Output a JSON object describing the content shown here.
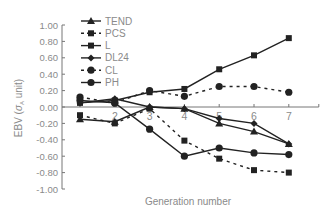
{
  "chart_data": {
    "type": "line",
    "title": "",
    "xlabel": "Generation number",
    "ylabel": "EBV (σA unit)",
    "ylabel_main": "EBV (",
    "ylabel_sigma": "σ",
    "ylabel_sub": "A",
    "ylabel_tail": " unit)",
    "x": [
      1,
      2,
      3,
      4,
      5,
      6,
      7
    ],
    "x_tick_labels": [
      "1",
      "2",
      "3",
      "4",
      "5",
      "6",
      "7"
    ],
    "ylim": [
      -1.0,
      1.0
    ],
    "y_ticks": [
      1.0,
      0.8,
      0.6,
      0.4,
      0.2,
      0.0,
      -0.2,
      -0.4,
      -0.6,
      -0.8,
      -1.0
    ],
    "y_tick_labels": [
      "1.00",
      "0.80",
      "0.60",
      "0.40",
      "0.20",
      "0.00",
      "-0.20",
      "-0.40",
      "-0.60",
      "-0.80",
      "-1.00"
    ],
    "grid": false,
    "legend_position": "upper-left",
    "series": [
      {
        "name": "TEND",
        "marker": "triangle",
        "dash": false,
        "values": [
          -0.15,
          -0.18,
          0.0,
          -0.02,
          -0.2,
          -0.3,
          -0.45
        ]
      },
      {
        "name": "PCS",
        "marker": "square",
        "dash": true,
        "values": [
          -0.1,
          -0.2,
          -0.02,
          -0.41,
          -0.63,
          -0.77,
          -0.8
        ]
      },
      {
        "name": "L",
        "marker": "square",
        "dash": false,
        "values": [
          0.05,
          0.08,
          0.18,
          0.22,
          0.46,
          0.63,
          0.84
        ]
      },
      {
        "name": "DL24",
        "marker": "diamond",
        "dash": false,
        "values": [
          0.05,
          0.1,
          0.0,
          -0.02,
          -0.14,
          -0.2,
          -0.45
        ]
      },
      {
        "name": "CL",
        "marker": "circle",
        "dash": true,
        "values": [
          0.12,
          0.05,
          0.2,
          0.13,
          0.25,
          0.25,
          0.18
        ]
      },
      {
        "name": "PH",
        "marker": "circle",
        "dash": false,
        "values": [
          0.08,
          0.05,
          -0.27,
          -0.6,
          -0.5,
          -0.56,
          -0.58
        ]
      }
    ]
  },
  "colors": {
    "line": "#222222",
    "axis": "#777777",
    "text": "#8a8a8a"
  }
}
